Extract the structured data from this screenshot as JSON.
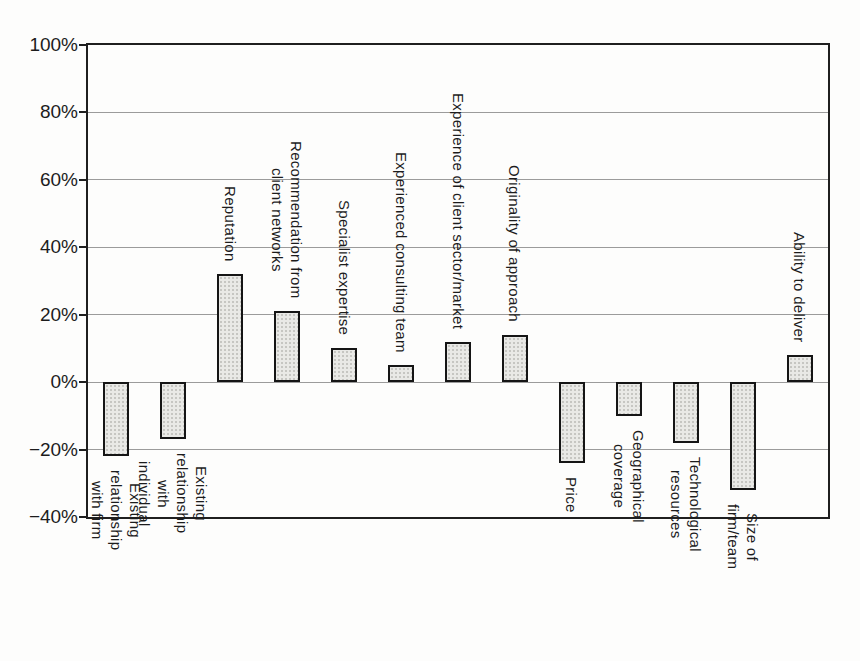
{
  "chart_data": {
    "type": "bar",
    "title": "",
    "subtitle": "",
    "categories": [
      "Existing relationship\nwith firm",
      "Existing relationship\nwith individual",
      "Reputation",
      "Recommendation from\nclient networks",
      "Specialist expertise",
      "Experienced consulting team",
      "Experience of client sector/market",
      "Originality of approach",
      "Price",
      "Geographical\ncoverage",
      "Technological\nresources",
      "Size of\nfirm/team",
      "Ability to deliver"
    ],
    "values": [
      -22,
      -17,
      32,
      21,
      10,
      5,
      12,
      14,
      -24,
      -10,
      -18,
      -32,
      8
    ],
    "unit": "%",
    "xlabel": "",
    "ylabel": "",
    "ylim": [
      -40,
      100
    ],
    "y_ticks": [
      100,
      80,
      60,
      40,
      20,
      0,
      -20,
      -40
    ],
    "y_tick_labels": [
      "100%",
      "80%",
      "60%",
      "40%",
      "20%",
      "0%",
      "−20%",
      "−40%"
    ],
    "grid": "horizontal",
    "legend": "none",
    "colors": {
      "bar_fill": "#e9e9e6",
      "bar_dot": "#c6c6c2",
      "bar_border": "#151515",
      "gridline": "#9b9b9b",
      "axis": "#1f1f1f",
      "text": "#1c1c1c",
      "background": "#fdfdfc"
    }
  }
}
